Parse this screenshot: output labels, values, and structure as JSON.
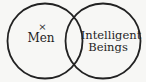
{
  "diagram": {
    "type": "venn",
    "circles": [
      {
        "id": "left",
        "cx": 45,
        "cy": 41,
        "r": 38,
        "label": "Men"
      },
      {
        "id": "right",
        "cx": 103,
        "cy": 41,
        "r": 38,
        "label_line1": "Intelligent",
        "label_line2": "Beings"
      }
    ],
    "marker": {
      "symbol": "×",
      "location": "left circle only"
    },
    "stroke_color": "#222222",
    "background_color": "#f7f7f5"
  }
}
